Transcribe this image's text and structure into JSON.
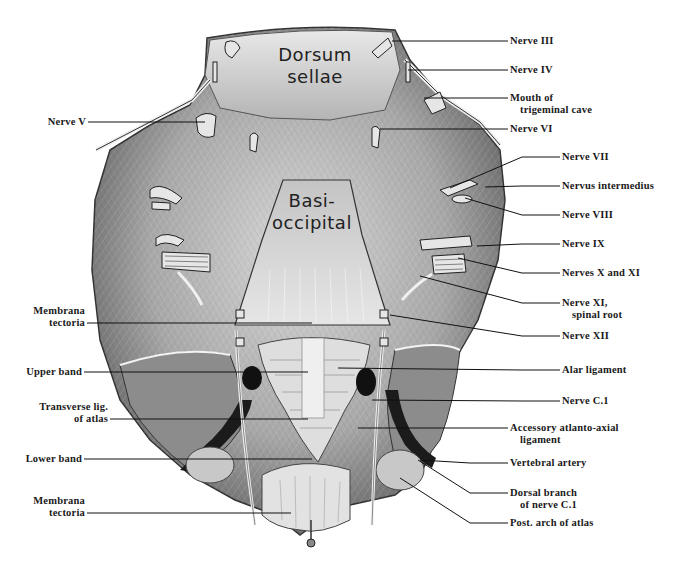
{
  "figure": {
    "inscriptions": {
      "dorsum": [
        "Dorsum",
        "sellae"
      ],
      "basi": [
        "Basi-",
        "occipital"
      ]
    },
    "labels_right": [
      {
        "id": "nerve-iii",
        "lines": [
          "Nerve III"
        ],
        "x": 510,
        "y": 36,
        "tx": 392,
        "ty": 41
      },
      {
        "id": "nerve-iv",
        "lines": [
          "Nerve IV"
        ],
        "x": 510,
        "y": 65,
        "tx": 408,
        "ty": 70
      },
      {
        "id": "mouth-trigeminal-cave",
        "lines": [
          "Mouth of",
          "trigeminal cave"
        ],
        "x": 510,
        "y": 93,
        "tx": 424,
        "ty": 98
      },
      {
        "id": "nerve-vi",
        "lines": [
          "Nerve VI"
        ],
        "x": 510,
        "y": 124,
        "tx": 380,
        "ty": 129
      },
      {
        "id": "nerve-vii",
        "lines": [
          "Nerve VII"
        ],
        "x": 562,
        "y": 152,
        "tx": 450,
        "ty": 188
      },
      {
        "id": "nervus-intermedius",
        "lines": [
          "Nervus intermedius"
        ],
        "x": 562,
        "y": 181,
        "tx": 485,
        "ty": 187
      },
      {
        "id": "nerve-viii",
        "lines": [
          "Nerve VIII"
        ],
        "x": 562,
        "y": 210,
        "tx": 465,
        "ty": 198
      },
      {
        "id": "nerve-ix",
        "lines": [
          "Nerve IX"
        ],
        "x": 562,
        "y": 239,
        "tx": 477,
        "ty": 246
      },
      {
        "id": "nerves-x-xi",
        "lines": [
          "Nerves X and XI"
        ],
        "x": 562,
        "y": 268,
        "tx": 458,
        "ty": 258
      },
      {
        "id": "nerve-xi-spinal",
        "lines": [
          "Nerve XI,",
          "spinal root"
        ],
        "x": 562,
        "y": 298,
        "tx": 420,
        "ty": 276
      },
      {
        "id": "nerve-xii",
        "lines": [
          "Nerve XII"
        ],
        "x": 562,
        "y": 331,
        "tx": 390,
        "ty": 315
      },
      {
        "id": "alar-ligament",
        "lines": [
          "Alar ligament"
        ],
        "x": 562,
        "y": 365,
        "tx": 338,
        "ty": 368
      },
      {
        "id": "nerve-c1",
        "lines": [
          "Nerve C.1"
        ],
        "x": 562,
        "y": 396,
        "tx": 372,
        "ty": 400
      },
      {
        "id": "accessory-atlanto-axial",
        "lines": [
          "Accessory atlanto-axial",
          "ligament"
        ],
        "x": 510,
        "y": 423,
        "tx": 358,
        "ty": 428
      },
      {
        "id": "vertebral-artery",
        "lines": [
          "Vertebral artery"
        ],
        "x": 510,
        "y": 458,
        "tx": 420,
        "ty": 460
      },
      {
        "id": "dorsal-branch-c1",
        "lines": [
          "Dorsal branch",
          "of nerve C.1"
        ],
        "x": 510,
        "y": 488,
        "tx": 418,
        "ty": 460
      },
      {
        "id": "post-arch-atlas",
        "lines": [
          "Post. arch of atlas"
        ],
        "x": 510,
        "y": 518,
        "tx": 400,
        "ty": 478
      }
    ],
    "labels_left": [
      {
        "id": "nerve-v",
        "lines": [
          "Nerve V"
        ],
        "x": 86,
        "y": 117,
        "tx": 205,
        "ty": 124
      },
      {
        "id": "membrana-tectoria-upper",
        "lines": [
          "Membrana",
          "tectoria"
        ],
        "x": 85,
        "y": 306,
        "tx": 312,
        "ty": 324
      },
      {
        "id": "upper-band",
        "lines": [
          "Upper band"
        ],
        "x": 82,
        "y": 367,
        "tx": 308,
        "ty": 375
      },
      {
        "id": "transverse-lig-atlas",
        "lines": [
          "Transverse lig.",
          "of atlas"
        ],
        "x": 108,
        "y": 402,
        "tx": 308,
        "ty": 417
      },
      {
        "id": "lower-band",
        "lines": [
          "Lower band"
        ],
        "x": 82,
        "y": 454,
        "tx": 312,
        "ty": 459
      },
      {
        "id": "membrana-tectoria-lower",
        "lines": [
          "Membrana",
          "tectoria"
        ],
        "x": 85,
        "y": 496,
        "tx": 291,
        "ty": 510
      }
    ]
  }
}
